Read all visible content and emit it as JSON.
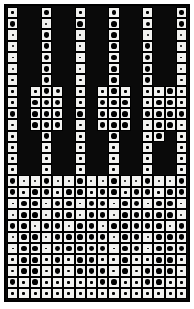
{
  "figure": {
    "title": "",
    "background_color": "#ffffff",
    "frame_color": "#000000",
    "cell_on_color": "#f2f2f0",
    "cell_off_color": "#0a0a0a",
    "blob_color": "#000000"
  },
  "chart_data": {
    "type": "heatmap",
    "subtype": "hinton-diagram",
    "title": "",
    "subtitle": "",
    "xlabel": "",
    "ylabel": "",
    "xticklabels": [],
    "yticklabels": [],
    "legend": [],
    "grid": true,
    "n_cols": 16,
    "n_rows": 26,
    "value_scale": {
      "0": "masked / no cell (solid black background)",
      "1": "empty cell (white, tiny marker)",
      "2": "small magnitude",
      "3": "medium magnitude",
      "4": "large magnitude",
      "5": "very large magnitude"
    },
    "note": "Each grid cell is white when active; the area of the black dot inside encodes magnitude. Value 0 means the cell is masked out and drawn as solid black.",
    "matrix": [
      [
        2,
        0,
        0,
        3,
        0,
        0,
        2,
        0,
        0,
        3,
        0,
        0,
        2,
        0,
        0,
        3
      ],
      [
        4,
        0,
        0,
        1,
        0,
        0,
        4,
        0,
        0,
        4,
        0,
        0,
        3,
        0,
        0,
        4
      ],
      [
        1,
        0,
        0,
        4,
        0,
        0,
        1,
        0,
        0,
        4,
        0,
        0,
        1,
        0,
        0,
        1
      ],
      [
        1,
        0,
        0,
        4,
        0,
        0,
        1,
        0,
        0,
        4,
        0,
        0,
        4,
        0,
        0,
        1
      ],
      [
        1,
        0,
        0,
        4,
        0,
        0,
        1,
        0,
        0,
        4,
        0,
        0,
        4,
        0,
        0,
        1
      ],
      [
        1,
        0,
        0,
        4,
        0,
        0,
        1,
        0,
        0,
        4,
        0,
        0,
        4,
        0,
        0,
        1
      ],
      [
        2,
        0,
        0,
        4,
        0,
        0,
        2,
        0,
        0,
        4,
        0,
        0,
        4,
        0,
        0,
        2
      ],
      [
        2,
        0,
        2,
        4,
        3,
        0,
        2,
        0,
        2,
        4,
        2,
        0,
        2,
        2,
        4,
        2
      ],
      [
        2,
        0,
        4,
        4,
        4,
        0,
        2,
        0,
        4,
        4,
        4,
        0,
        2,
        4,
        4,
        2
      ],
      [
        4,
        0,
        4,
        4,
        4,
        0,
        4,
        0,
        4,
        4,
        4,
        0,
        4,
        4,
        4,
        4
      ],
      [
        2,
        0,
        4,
        4,
        4,
        0,
        2,
        0,
        4,
        4,
        4,
        0,
        2,
        4,
        4,
        2
      ],
      [
        2,
        0,
        0,
        4,
        0,
        0,
        2,
        0,
        0,
        4,
        0,
        0,
        2,
        4,
        0,
        2
      ],
      [
        2,
        0,
        0,
        2,
        0,
        0,
        2,
        0,
        0,
        2,
        0,
        0,
        2,
        0,
        0,
        2
      ],
      [
        2,
        0,
        0,
        2,
        0,
        0,
        2,
        0,
        0,
        2,
        0,
        0,
        2,
        0,
        0,
        2
      ],
      [
        2,
        0,
        0,
        2,
        0,
        0,
        2,
        0,
        0,
        2,
        0,
        0,
        2,
        0,
        0,
        2
      ],
      [
        4,
        1,
        1,
        4,
        1,
        1,
        4,
        1,
        1,
        4,
        1,
        1,
        4,
        1,
        1,
        4
      ],
      [
        4,
        2,
        4,
        4,
        2,
        4,
        4,
        2,
        4,
        4,
        2,
        4,
        4,
        2,
        4,
        4
      ],
      [
        1,
        4,
        4,
        1,
        4,
        4,
        1,
        4,
        4,
        1,
        4,
        4,
        1,
        4,
        4,
        1
      ],
      [
        1,
        4,
        4,
        1,
        4,
        4,
        1,
        4,
        4,
        1,
        4,
        4,
        4,
        4,
        4,
        1
      ],
      [
        4,
        4,
        1,
        4,
        4,
        1,
        4,
        4,
        1,
        4,
        4,
        4,
        4,
        4,
        1,
        4
      ],
      [
        1,
        4,
        4,
        1,
        4,
        4,
        4,
        4,
        4,
        1,
        4,
        4,
        1,
        4,
        4,
        4
      ],
      [
        1,
        4,
        4,
        1,
        4,
        4,
        4,
        4,
        4,
        1,
        4,
        4,
        1,
        4,
        4,
        4
      ],
      [
        2,
        4,
        4,
        2,
        4,
        2,
        4,
        4,
        2,
        2,
        4,
        2,
        2,
        4,
        4,
        2
      ],
      [
        2,
        4,
        4,
        2,
        4,
        2,
        4,
        4,
        4,
        2,
        4,
        2,
        4,
        4,
        4,
        2
      ],
      [
        4,
        2,
        4,
        2,
        2,
        2,
        2,
        2,
        4,
        4,
        2,
        2,
        4,
        4,
        2,
        2
      ],
      [
        2,
        2,
        2,
        2,
        2,
        2,
        2,
        2,
        2,
        2,
        2,
        2,
        2,
        2,
        2,
        2
      ]
    ]
  }
}
